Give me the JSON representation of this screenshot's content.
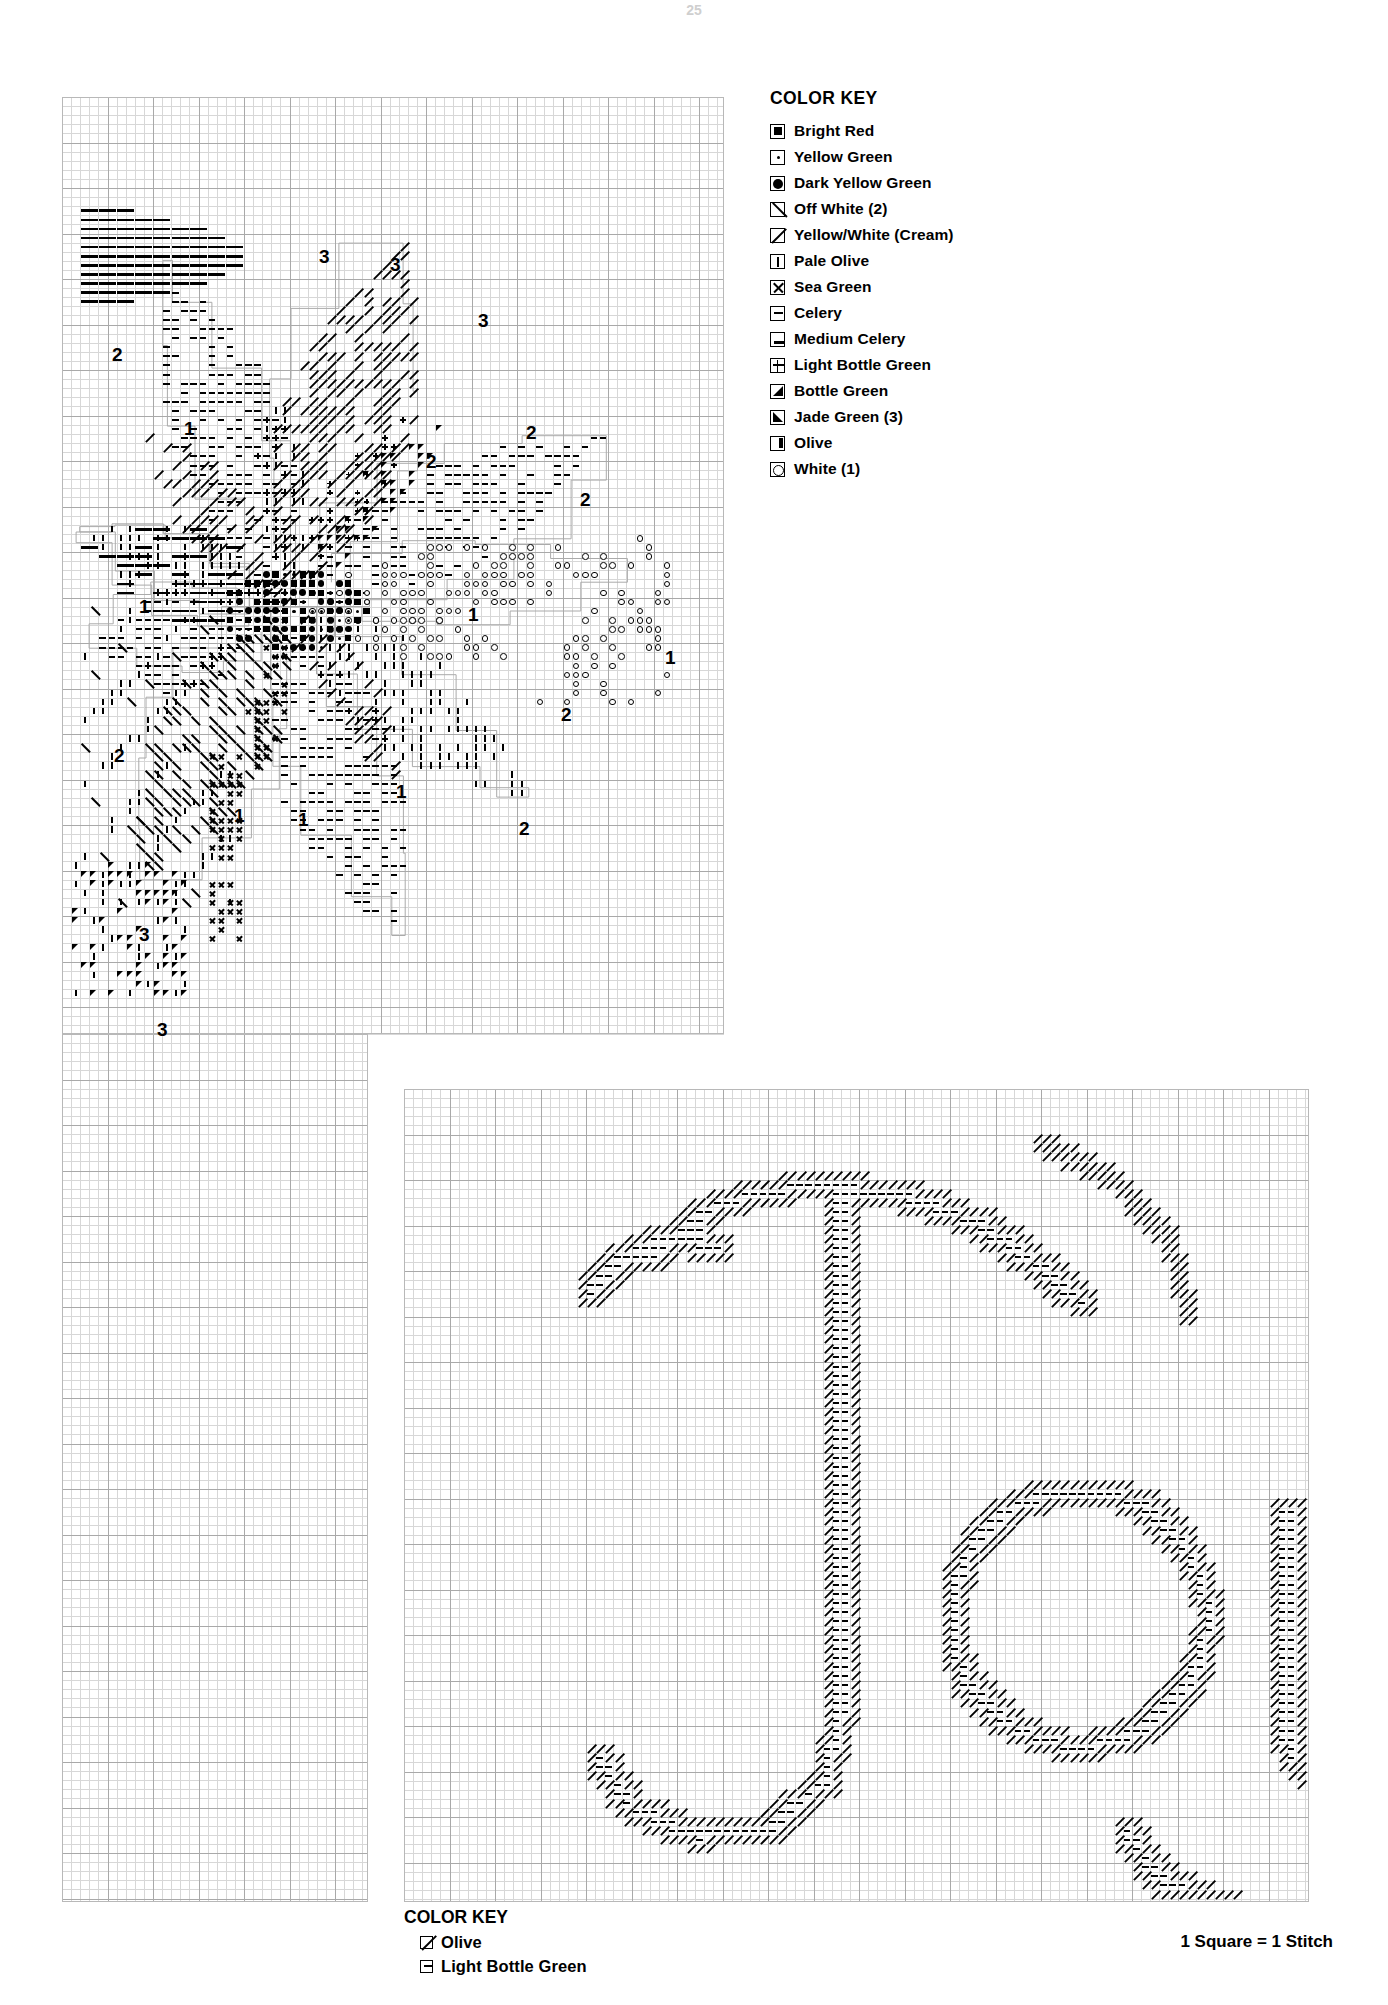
{
  "document": {
    "type": "cross-stitch-pattern-chart",
    "page_number": "25"
  },
  "color_key": {
    "title": "COLOR KEY",
    "items": [
      {
        "symbol": "filled-square-in-box",
        "label": "Bright Red"
      },
      {
        "symbol": "dot-in-box",
        "label": "Yellow Green"
      },
      {
        "symbol": "filled-circle-in-box",
        "label": "Dark Yellow Green"
      },
      {
        "symbol": "backslash-in-box",
        "label": "Off White (2)"
      },
      {
        "symbol": "forwardslash-in-box",
        "label": "Yellow/White (Cream)"
      },
      {
        "symbol": "i-bar-in-box",
        "label": "Pale Olive"
      },
      {
        "symbol": "x-in-box",
        "label": "Sea Green"
      },
      {
        "symbol": "minus-in-box",
        "label": "Celery"
      },
      {
        "symbol": "bottom-bar-in-box",
        "label": "Medium Celery"
      },
      {
        "symbol": "plus-in-box",
        "label": "Light Bottle Green"
      },
      {
        "symbol": "triangle-lower-left",
        "label": "Bottle Green"
      },
      {
        "symbol": "triangle-lower-right",
        "label": "Jade Green (3)"
      },
      {
        "symbol": "right-bar-in-box",
        "label": "Olive"
      },
      {
        "symbol": "open-circle-in-box",
        "label": "White (1)"
      }
    ]
  },
  "bottom_color_key": {
    "title": "COLOR KEY",
    "items": [
      {
        "symbol": "forwardslash-in-box",
        "label": "Olive"
      },
      {
        "symbol": "minus-in-box",
        "label": "Light Bottle Green"
      }
    ]
  },
  "footer": {
    "scale_note": "1 Square = 1 Stitch"
  },
  "main_chart": {
    "name": "poinsettia-flower-chart",
    "region_labels": [
      {
        "text": "2",
        "x": 50,
        "y": 248
      },
      {
        "text": "3",
        "x": 257,
        "y": 150
      },
      {
        "text": "3",
        "x": 328,
        "y": 158
      },
      {
        "text": "3",
        "x": 416,
        "y": 214
      },
      {
        "text": "1",
        "x": 122,
        "y": 322
      },
      {
        "text": "2",
        "x": 464,
        "y": 326
      },
      {
        "text": "2",
        "x": 364,
        "y": 355
      },
      {
        "text": "2",
        "x": 518,
        "y": 393
      },
      {
        "text": "1",
        "x": 77,
        "y": 500
      },
      {
        "text": "1",
        "x": 406,
        "y": 508
      },
      {
        "text": "1",
        "x": 603,
        "y": 551
      },
      {
        "text": "2",
        "x": 499,
        "y": 608
      },
      {
        "text": "2",
        "x": 52,
        "y": 649
      },
      {
        "text": "1",
        "x": 334,
        "y": 685
      },
      {
        "text": "1",
        "x": 172,
        "y": 709
      },
      {
        "text": "1",
        "x": 236,
        "y": 713
      },
      {
        "text": "2",
        "x": 457,
        "y": 722
      },
      {
        "text": "3",
        "x": 77,
        "y": 828
      },
      {
        "text": "3",
        "x": 95,
        "y": 923
      }
    ]
  },
  "letter_chart": {
    "name": "joy-lettering-chart",
    "word": "Joy"
  }
}
